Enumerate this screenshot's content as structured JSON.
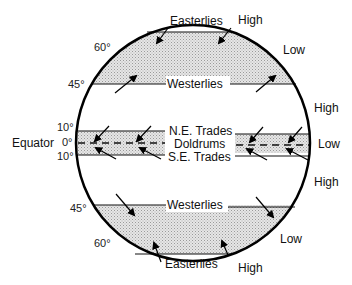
{
  "diagram": {
    "latitude_labels": {
      "north_60": "60°",
      "north_45": "45°",
      "north_10": "10°",
      "equator_0": "0°",
      "south_10": "10°",
      "south_45": "45°",
      "south_60": "60°"
    },
    "equator_label": "Equator",
    "wind_belts": {
      "north_easterlies": "Easterlies",
      "north_westerlies": "Westerlies",
      "ne_trades": "N.E. Trades",
      "doldrums": "Doldrums",
      "se_trades": "S.E. Trades",
      "south_westerlies": "Westerlies",
      "south_easterlies": "Easterlies"
    },
    "pressure_labels": {
      "north_polar_high": "High",
      "north_subpolar_low": "Low",
      "north_subtropical_high": "High",
      "equatorial_low": "Low",
      "south_subtropical_high": "High",
      "south_subpolar_low": "Low",
      "south_polar_high": "High"
    },
    "colors": {
      "outline": "#000000",
      "shade": "#d9d9d9",
      "text": "#111111"
    }
  }
}
